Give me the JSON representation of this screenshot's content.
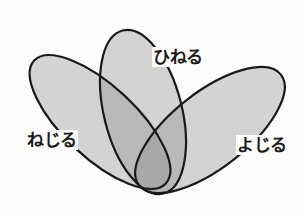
{
  "diagram": {
    "type": "venn-3-petal",
    "sets": [
      {
        "id": "nejiru",
        "label": "ねじる"
      },
      {
        "id": "hineru",
        "label": "ひねる"
      },
      {
        "id": "yojiru",
        "label": "よじる"
      }
    ],
    "colors": {
      "fill": "#8f8f8f",
      "stroke": "#1a1a1a",
      "background": "#fdfdfb"
    }
  }
}
